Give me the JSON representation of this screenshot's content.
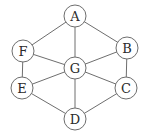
{
  "graph": {
    "type": "undirected",
    "nodes": [
      {
        "id": "A",
        "label": "A",
        "x": 75,
        "y": 16
      },
      {
        "id": "B",
        "label": "B",
        "x": 127,
        "y": 48
      },
      {
        "id": "C",
        "label": "C",
        "x": 126,
        "y": 88
      },
      {
        "id": "D",
        "label": "D",
        "x": 75,
        "y": 119
      },
      {
        "id": "E",
        "label": "E",
        "x": 22,
        "y": 88
      },
      {
        "id": "F",
        "label": "F",
        "x": 23,
        "y": 51
      },
      {
        "id": "G",
        "label": "G",
        "x": 75,
        "y": 68
      }
    ],
    "edges": [
      [
        "A",
        "F"
      ],
      [
        "A",
        "B"
      ],
      [
        "A",
        "G"
      ],
      [
        "F",
        "G"
      ],
      [
        "F",
        "E"
      ],
      [
        "B",
        "G"
      ],
      [
        "B",
        "C"
      ],
      [
        "G",
        "E"
      ],
      [
        "G",
        "C"
      ],
      [
        "G",
        "D"
      ],
      [
        "E",
        "D"
      ],
      [
        "C",
        "D"
      ]
    ],
    "node_radius": 11,
    "colors": {
      "stroke": "#6e6e6e",
      "fill": "#ffffff",
      "text": "#2a2a2a"
    }
  }
}
